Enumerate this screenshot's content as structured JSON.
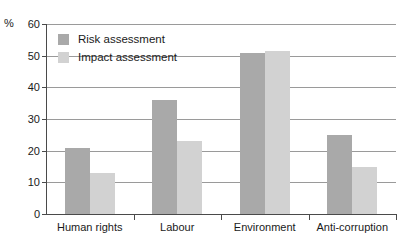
{
  "chart_data": {
    "type": "bar",
    "title": "",
    "subtitle": "",
    "xlabel": "",
    "ylabel": "%",
    "ylim": [
      0,
      60
    ],
    "yticks": [
      0,
      10,
      20,
      30,
      40,
      50,
      60
    ],
    "grid": true,
    "legend_position": "inside-top-left",
    "categories": [
      "Human rights",
      "Labour",
      "Environment",
      "Anti-corruption"
    ],
    "series": [
      {
        "name": "Risk assessment",
        "color": "#a9a9a9",
        "values": [
          21,
          36,
          51,
          25
        ]
      },
      {
        "name": "Impact assessment",
        "color": "#d2d2d2",
        "values": [
          13,
          23,
          51.5,
          15
        ]
      }
    ]
  },
  "axis": {
    "unit_label": "%",
    "tick_labels": [
      "60",
      "50",
      "40",
      "30",
      "20",
      "10",
      "0"
    ]
  },
  "legend": {
    "items": [
      {
        "label": "Risk assessment",
        "color": "#a9a9a9"
      },
      {
        "label": "Impact assessment",
        "color": "#d2d2d2"
      }
    ]
  },
  "colors": {
    "risk": "#a9a9a9",
    "impact": "#d2d2d2",
    "gridline": "#9a9a9a",
    "axis": "#4a4a4a",
    "text": "#1a1a1a",
    "background": "#ffffff"
  }
}
